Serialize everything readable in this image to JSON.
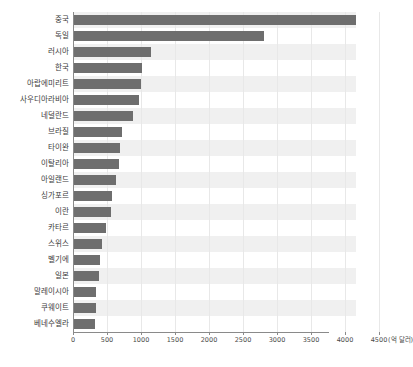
{
  "chart_data": {
    "type": "bar",
    "orientation": "horizontal",
    "title": "",
    "subtitle": "",
    "xlabel": "",
    "ylabel": "",
    "unit_label": "(억 달러)",
    "xlim": [
      0,
      4500
    ],
    "ylim": null,
    "grid": true,
    "legend": null,
    "legend_position": "none",
    "bar_color": "#6e6e6e",
    "band_color": "#f0f0f0",
    "axis_color": "#8a8a8a",
    "gridline_color": "#e8e8e8",
    "tick_labels": [
      "0",
      "500",
      "1000",
      "1500",
      "2000",
      "2500",
      "3000",
      "3500",
      "4000",
      "4500"
    ],
    "ticks": [
      0,
      500,
      1000,
      1500,
      2000,
      2500,
      3000,
      3500,
      4000,
      4500
    ],
    "categories": [
      "중국",
      "독일",
      "러시아",
      "한국",
      "아랍에미리트",
      "사우디아라비아",
      "네덜란드",
      "브라질",
      "타이완",
      "이탈리아",
      "아일랜드",
      "싱가포르",
      "이란",
      "카타르",
      "스위스",
      "벨기에",
      "일본",
      "말레이시아",
      "쿠웨이트",
      "베네수엘라"
    ],
    "values": [
      4150,
      2800,
      1130,
      1000,
      990,
      960,
      870,
      700,
      680,
      660,
      620,
      560,
      550,
      470,
      410,
      380,
      370,
      330,
      320,
      310
    ]
  }
}
